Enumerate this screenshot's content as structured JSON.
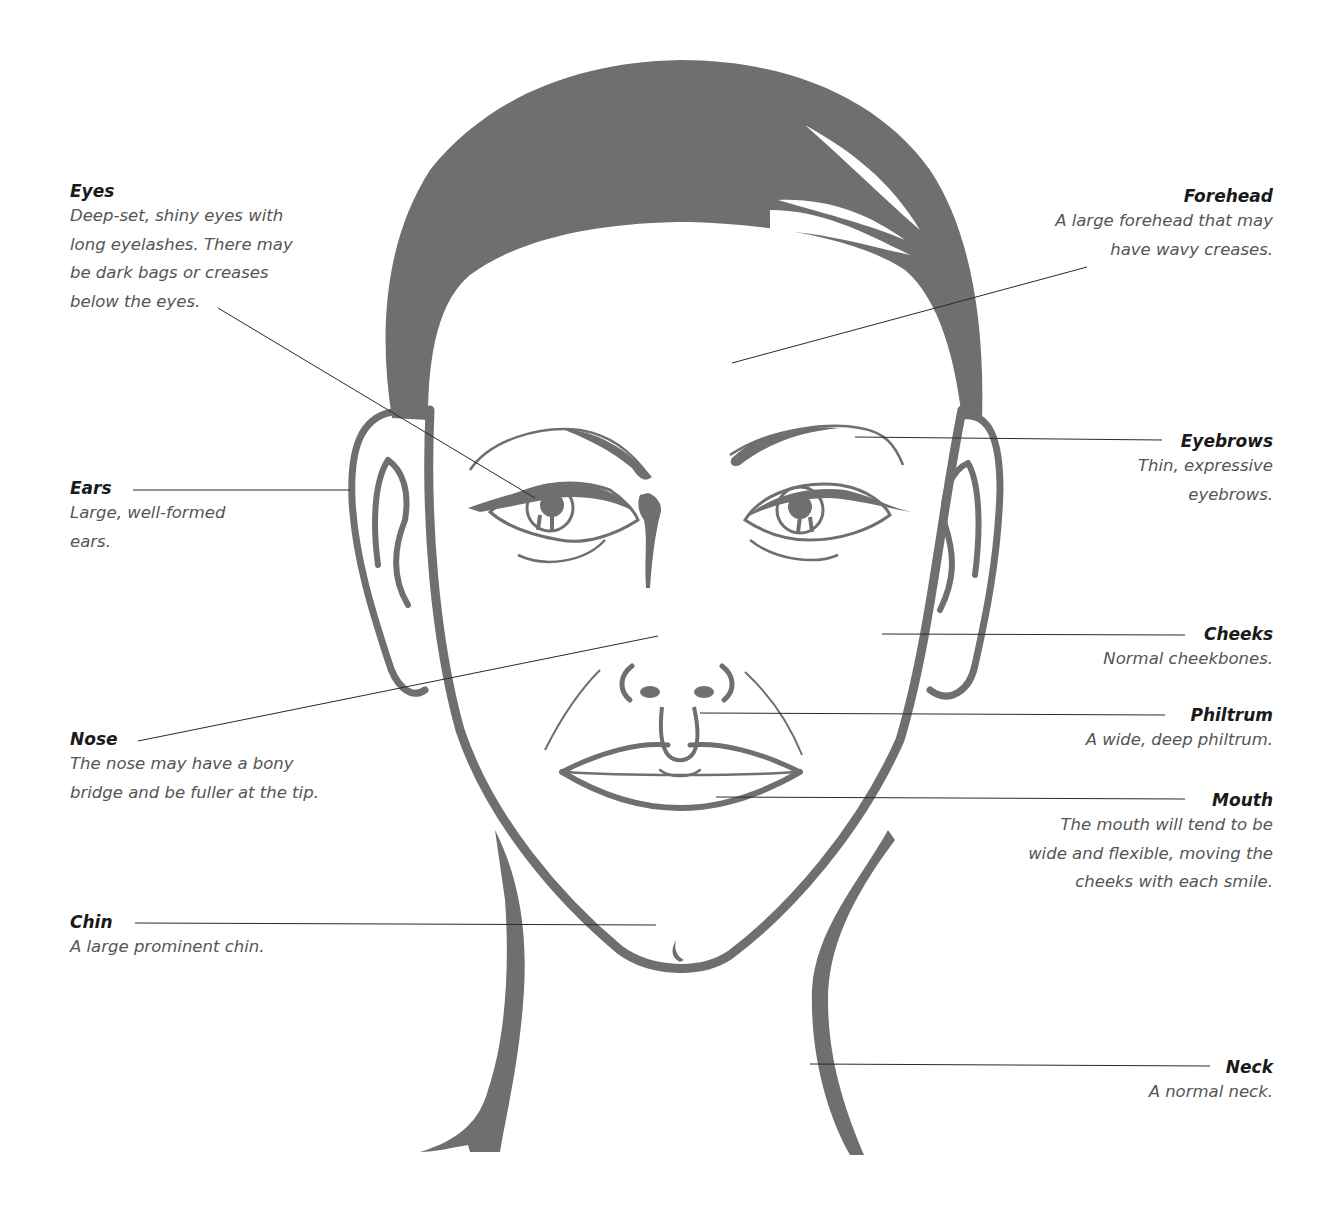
{
  "colors": {
    "illustration_gray": "#6f6f6f",
    "leader_line": "#2a2a2a",
    "title_text": "#1a1a1a",
    "desc_text": "#555555",
    "background": "#ffffff"
  },
  "annotations": {
    "eyes": {
      "title": "Eyes",
      "desc": "Deep-set, shiny eyes with\nlong eyelashes. There may\nbe dark bags or creases\nbelow the eyes."
    },
    "forehead": {
      "title": "Forehead",
      "desc": "A large forehead that may\nhave wavy creases."
    },
    "ears": {
      "title": "Ears",
      "desc": "Large, well-formed\nears."
    },
    "eyebrows": {
      "title": "Eyebrows",
      "desc": "Thin, expressive\neyebrows."
    },
    "cheeks": {
      "title": "Cheeks",
      "desc": "Normal cheekbones."
    },
    "philtrum": {
      "title": "Philtrum",
      "desc": "A wide, deep philtrum."
    },
    "nose": {
      "title": "Nose",
      "desc": "The nose may have a bony\nbridge and be fuller at the tip."
    },
    "mouth": {
      "title": "Mouth",
      "desc": "The mouth will tend to be\nwide and flexible, moving the\ncheeks with each smile."
    },
    "chin": {
      "title": "Chin",
      "desc": "A large prominent chin."
    },
    "neck": {
      "title": "Neck",
      "desc": "A normal neck."
    }
  }
}
